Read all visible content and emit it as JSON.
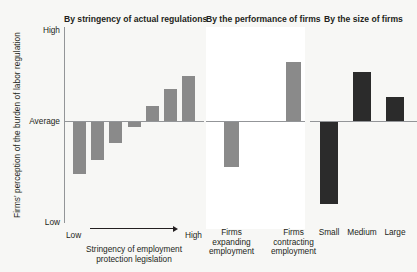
{
  "chart_data": {
    "type": "bar",
    "title": "",
    "ylabel": "Firms' perception of the burden of labor regulation",
    "ytick_labels": [
      "High",
      "Average",
      "Low"
    ],
    "ylim": [
      -1.0,
      1.0
    ],
    "grid": false,
    "legend": "none",
    "panels": [
      {
        "title": "By stringency of actual regulations",
        "xlabel_caption": "Stringency of employment\nprotection legislation",
        "axis_start_label": "Low",
        "axis_end_label": "High",
        "bar_color": "#8a8a8a",
        "categories": [
          "1",
          "2",
          "3",
          "4",
          "5",
          "6",
          "7"
        ],
        "values": [
          -0.52,
          -0.39,
          -0.22,
          -0.06,
          0.16,
          0.34,
          0.48
        ]
      },
      {
        "title": "By the performance of firms",
        "bar_color": "#8a8a8a",
        "categories": [
          "Firms expanding employment",
          "Firms contracting employment"
        ],
        "category_lines": [
          [
            "Firms",
            "expanding",
            "employment"
          ],
          [
            "Firms",
            "contracting",
            "employment"
          ]
        ],
        "values": [
          -0.46,
          0.63
        ]
      },
      {
        "title": "By the size of firms",
        "bar_color": "#2b2b2b",
        "categories": [
          "Small",
          "Medium",
          "Large"
        ],
        "category_lines": [
          [
            "Small"
          ],
          [
            "Medium"
          ],
          [
            "Large"
          ]
        ],
        "values": [
          -0.82,
          0.53,
          0.26
        ]
      }
    ]
  },
  "colors": {
    "background": "#f7f7f5",
    "panel_white": "#ffffff",
    "bar_gray": "#8a8a8a",
    "bar_dark": "#2b2b2b",
    "axis": "#939598",
    "text": "#231f20"
  }
}
